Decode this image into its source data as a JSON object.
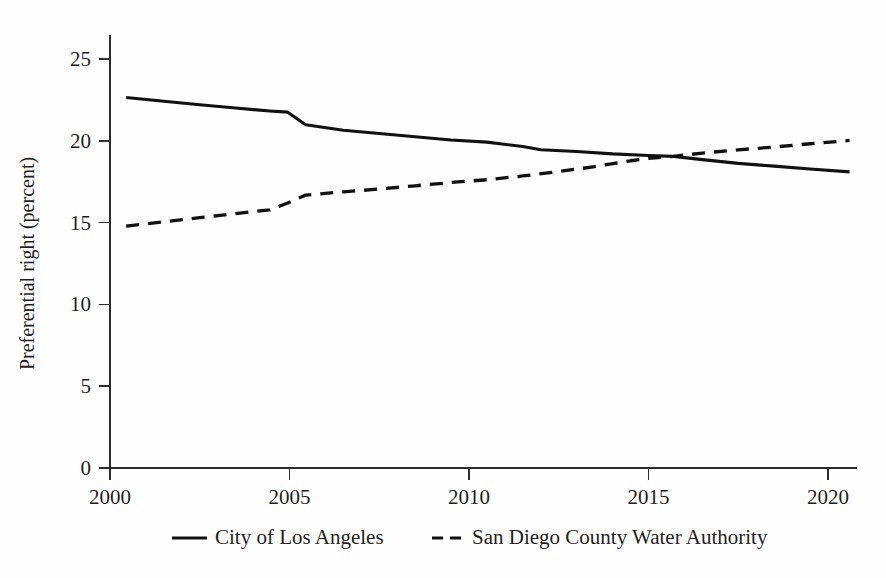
{
  "chart_data": {
    "type": "line",
    "title": "",
    "subtitle": "",
    "xlabel": "",
    "ylabel": "Preferential right (percent)",
    "xlim": [
      2000,
      2020.95
    ],
    "ylim": [
      0,
      26.5
    ],
    "xticks": [
      2000,
      2005,
      2010,
      2015,
      2020
    ],
    "xticklabels": [
      "2000",
      "2005",
      "2010",
      "2015",
      "2020"
    ],
    "yticks": [
      0,
      5,
      10,
      15,
      20,
      25
    ],
    "yticklabels": [
      "0",
      "5",
      "10",
      "15",
      "20",
      "25"
    ],
    "grid": false,
    "legend_position": "bottom-center",
    "series": [
      {
        "name": "City of Los Angeles",
        "style": "solid",
        "color": "#111111",
        "x": [
          2000.45,
          2001.5,
          2002.5,
          2003.5,
          2004.45,
          2004.95,
          2005.45,
          2006.5,
          2007.5,
          2008.5,
          2009.5,
          2010.5,
          2011.5,
          2012.0,
          2013.0,
          2014.0,
          2015.0,
          2015.7,
          2016.5,
          2017.5,
          2018.5,
          2019.5,
          2020.6
        ],
        "y": [
          22.65,
          22.42,
          22.2,
          22.0,
          21.82,
          21.75,
          20.98,
          20.65,
          20.45,
          20.25,
          20.05,
          19.92,
          19.65,
          19.45,
          19.35,
          19.2,
          19.1,
          19.05,
          18.85,
          18.62,
          18.45,
          18.28,
          18.1
        ]
      },
      {
        "name": "San Diego County Water Authority",
        "style": "dashed",
        "color": "#111111",
        "x": [
          2000.45,
          2001.5,
          2002.5,
          2003.5,
          2004.45,
          2004.95,
          2005.45,
          2006.5,
          2007.5,
          2008.5,
          2009.5,
          2010.5,
          2011.5,
          2012.5,
          2013.5,
          2014.5,
          2015.0,
          2015.7,
          2016.5,
          2017.5,
          2018.5,
          2019.5,
          2020.6
        ],
        "y": [
          14.78,
          15.05,
          15.3,
          15.55,
          15.78,
          16.2,
          16.68,
          16.88,
          17.05,
          17.25,
          17.45,
          17.62,
          17.85,
          18.12,
          18.42,
          18.78,
          18.92,
          19.05,
          19.25,
          19.45,
          19.62,
          19.82,
          20.02
        ]
      }
    ],
    "annotations": []
  },
  "legend": {
    "items": [
      {
        "label": "City of Los Angeles",
        "style": "solid"
      },
      {
        "label": "San Diego County Water Authority",
        "style": "dashed"
      }
    ]
  }
}
